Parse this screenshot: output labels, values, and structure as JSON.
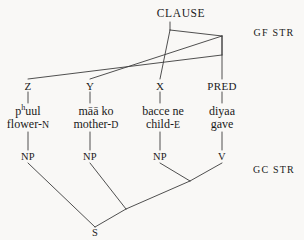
{
  "diagram": {
    "type": "syntax-tree",
    "root_label": "CLAUSE",
    "tiers": {
      "gf_label": "GF STR",
      "gc_label": "GC STR"
    },
    "gf_nodes": [
      {
        "id": "z",
        "label": "Z",
        "x": 28,
        "y": 86
      },
      {
        "id": "y",
        "label": "Y",
        "x": 90,
        "y": 86
      },
      {
        "id": "x",
        "label": "X",
        "x": 160,
        "y": 86
      },
      {
        "id": "pred",
        "label": "PRED",
        "x": 222,
        "y": 86
      }
    ],
    "words": [
      {
        "id": "w1",
        "surface_pre": "p",
        "surface_sup": "h",
        "surface_post": "uul",
        "surface": "pʰuul",
        "gloss_stem": "flower-",
        "gloss_gram": "N",
        "gloss": "flower-N",
        "x": 28,
        "word_y": 111,
        "gloss_y": 124
      },
      {
        "id": "w2",
        "surface_pre": "māā ko",
        "surface_sup": "",
        "surface_post": "",
        "surface": "māā ko",
        "gloss_stem": "mother-",
        "gloss_gram": "D",
        "gloss": "mother-D",
        "x": 96,
        "word_y": 111,
        "gloss_y": 124
      },
      {
        "id": "w3",
        "surface_pre": "bacce ne",
        "surface_sup": "",
        "surface_post": "",
        "surface": "bacce ne",
        "gloss_stem": "child-",
        "gloss_gram": "E",
        "gloss": "child-E",
        "x": 163,
        "word_y": 111,
        "gloss_y": 124
      },
      {
        "id": "w4",
        "surface_pre": "diyaa",
        "surface_sup": "",
        "surface_post": "",
        "surface": "diyaa",
        "gloss_stem": "gave",
        "gloss_gram": "",
        "gloss": "gave",
        "x": 222,
        "word_y": 111,
        "gloss_y": 124
      }
    ],
    "gc_nodes": [
      {
        "id": "np1",
        "label": "NP",
        "x": 28,
        "y": 157
      },
      {
        "id": "np2",
        "label": "NP",
        "x": 90,
        "y": 157
      },
      {
        "id": "np3",
        "label": "NP",
        "x": 160,
        "y": 157
      },
      {
        "id": "v",
        "label": "V",
        "x": 222,
        "y": 157
      },
      {
        "id": "s",
        "label": "S",
        "x": 95,
        "y": 233
      }
    ],
    "clause": {
      "label": "CLAUSE",
      "x": 181,
      "y": 14
    },
    "colors": {
      "background": "#f9f8f6",
      "ink": "#1a1a1a",
      "line": "#3c3c3c"
    }
  }
}
